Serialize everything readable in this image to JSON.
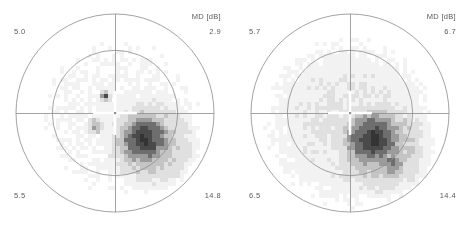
{
  "figure": {
    "background_color": "#ffffff",
    "outline_color": "#8c8c8c",
    "text_color": "#5a5a5a"
  },
  "panels": [
    {
      "id": "left-eye-grayscale",
      "md_label": "MD [dB]",
      "md_value": "2.9",
      "corner_top_left": "5.0",
      "corner_top_right": "2.9",
      "corner_bottom_left": "5.5",
      "corner_bottom_right": "14.8"
    },
    {
      "id": "right-eye-grayscale",
      "md_label": "MD [dB]",
      "md_value": "6.7",
      "corner_top_left": "5.7",
      "corner_top_right": "6.7",
      "corner_bottom_left": "6.5",
      "corner_bottom_right": "14.4"
    }
  ],
  "chart_data": {
    "type": "heatmap",
    "title": "",
    "subtitle": "",
    "xlabel": "",
    "ylabel": "",
    "grid": false,
    "legend_position": "none",
    "colorscale": {
      "name": "grayscale-defect",
      "stops": [
        {
          "level": 0,
          "label": "normal",
          "hex": "#ffffff"
        },
        {
          "level": 1,
          "label": "minimal",
          "hex": "#f2f2f2"
        },
        {
          "level": 2,
          "label": "mild",
          "hex": "#e0e0e0"
        },
        {
          "level": 3,
          "label": "moderate",
          "hex": "#c4c4c4"
        },
        {
          "level": 4,
          "label": "marked",
          "hex": "#9b9b9b"
        },
        {
          "level": 5,
          "label": "severe",
          "hex": "#6e6e6e"
        },
        {
          "level": 6,
          "label": "profound",
          "hex": "#4a4a4a"
        },
        {
          "level": 7,
          "label": "absolute",
          "hex": "#343434"
        }
      ]
    },
    "axes": {
      "outer_circle_deg": 30,
      "inner_circle_deg": 10,
      "meridians_deg": [
        0,
        90,
        180,
        270
      ]
    },
    "series": [
      {
        "name": "left-eye-grayscale",
        "md_db": 2.9,
        "corner_values": {
          "top_left": 5.0,
          "top_right": 2.9,
          "bottom_left": 5.5,
          "bottom_right": 14.8
        },
        "defect_clusters": [
          {
            "name": "inferotemporal-dense-scotoma",
            "cx_deg": 9,
            "cy_deg": -8,
            "radius_deg": 10,
            "peak_level": 7
          },
          {
            "name": "inferotemporal-halo",
            "cx_deg": 11,
            "cy_deg": -9,
            "radius_deg": 15,
            "peak_level": 4
          },
          {
            "name": "superior-paracentral-spot",
            "cx_deg": -3,
            "cy_deg": 5,
            "radius_deg": 2,
            "peak_level": 6
          },
          {
            "name": "nasal-paracentral-spot",
            "cx_deg": -6,
            "cy_deg": -4,
            "radius_deg": 3,
            "peak_level": 4
          },
          {
            "name": "diffuse-background-depression",
            "cx_deg": 2,
            "cy_deg": -2,
            "radius_deg": 24,
            "peak_level": 1
          }
        ]
      },
      {
        "name": "right-eye-grayscale",
        "md_db": 6.7,
        "corner_values": {
          "top_left": 5.7,
          "top_right": 6.7,
          "bottom_left": 6.5,
          "bottom_right": 14.4
        },
        "defect_clusters": [
          {
            "name": "inferotemporal-dense-scotoma",
            "cx_deg": 7,
            "cy_deg": -8,
            "radius_deg": 11,
            "peak_level": 7
          },
          {
            "name": "inferotemporal-halo",
            "cx_deg": 9,
            "cy_deg": -10,
            "radius_deg": 17,
            "peak_level": 4
          },
          {
            "name": "inferior-extension",
            "cx_deg": 13,
            "cy_deg": -15,
            "radius_deg": 6,
            "peak_level": 5
          },
          {
            "name": "diffuse-background-depression",
            "cx_deg": 0,
            "cy_deg": -3,
            "radius_deg": 26,
            "peak_level": 2
          }
        ]
      }
    ]
  }
}
